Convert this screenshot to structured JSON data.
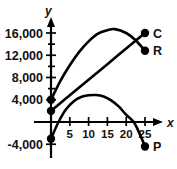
{
  "chart_data": {
    "type": "line",
    "title": "",
    "xlabel": "x",
    "ylabel": "y",
    "xlim": [
      -1.5,
      28
    ],
    "ylim": [
      -6000,
      18500
    ],
    "grid": false,
    "legend_position": "right-of-curve-endpoints",
    "x_ticks": [
      5,
      10,
      15,
      20,
      25
    ],
    "x_tick_labels": [
      "5",
      "10",
      "15",
      "20",
      "25"
    ],
    "y_ticks": [
      4000,
      8000,
      12000,
      16000
    ],
    "y_tick_labels": [
      "4,000",
      "8,000",
      "12,000",
      "16,000"
    ],
    "y_extra_tick_labels": [
      "-4,000"
    ],
    "y_extra_ticks": [
      -4000
    ],
    "series": [
      {
        "name": "C",
        "label": "C",
        "kind": "line",
        "description": "cost, straight increasing line",
        "y_intercept": 2000,
        "endpoint": {
          "x": 25,
          "y": 16000
        },
        "points": [
          {
            "x": 0,
            "y": 2000
          },
          {
            "x": 5,
            "y": 4800
          },
          {
            "x": 10,
            "y": 7600
          },
          {
            "x": 15,
            "y": 10400
          },
          {
            "x": 20,
            "y": 13200
          },
          {
            "x": 25,
            "y": 16000
          }
        ]
      },
      {
        "name": "R",
        "label": "R",
        "kind": "parabola",
        "description": "revenue, concave-down curve peaking near x=17",
        "y_intercept": 4000,
        "vertex": {
          "x": 17,
          "y": 16700
        },
        "endpoint": {
          "x": 25,
          "y": 12800
        },
        "points": [
          {
            "x": 0,
            "y": 4000
          },
          {
            "x": 2.5,
            "y": 7400
          },
          {
            "x": 5,
            "y": 10200
          },
          {
            "x": 7.5,
            "y": 12600
          },
          {
            "x": 10,
            "y": 14500
          },
          {
            "x": 12.5,
            "y": 15900
          },
          {
            "x": 15,
            "y": 16500
          },
          {
            "x": 17,
            "y": 16700
          },
          {
            "x": 20,
            "y": 16000
          },
          {
            "x": 22.5,
            "y": 14700
          },
          {
            "x": 25,
            "y": 12800
          }
        ]
      },
      {
        "name": "P",
        "label": "P",
        "kind": "parabola",
        "description": "profit = R - C, concave-down curve peaking near x=12",
        "y_intercept": -3000,
        "vertex": {
          "x": 12,
          "y": 4800
        },
        "endpoint": {
          "x": 25,
          "y": -4400
        },
        "x_intercepts": [
          2,
          22
        ],
        "points": [
          {
            "x": 0,
            "y": -3000
          },
          {
            "x": 2,
            "y": 0
          },
          {
            "x": 4,
            "y": 2300
          },
          {
            "x": 6,
            "y": 3700
          },
          {
            "x": 8,
            "y": 4500
          },
          {
            "x": 10,
            "y": 4800
          },
          {
            "x": 12,
            "y": 4850
          },
          {
            "x": 14,
            "y": 4600
          },
          {
            "x": 16,
            "y": 3900
          },
          {
            "x": 18,
            "y": 2800
          },
          {
            "x": 20,
            "y": 1300
          },
          {
            "x": 22,
            "y": 0
          },
          {
            "x": 23.5,
            "y": -2000
          },
          {
            "x": 25,
            "y": -4400
          }
        ]
      }
    ],
    "marked_points": [
      {
        "label": "",
        "x": 0,
        "y": 4000,
        "series": "R"
      },
      {
        "label": "",
        "x": 0,
        "y": 2000,
        "series": "C"
      },
      {
        "label": "",
        "x": 0,
        "y": -3000,
        "series": "P"
      },
      {
        "label": "C",
        "x": 25,
        "y": 16000,
        "series": "C"
      },
      {
        "label": "R",
        "x": 25,
        "y": 12800,
        "series": "R"
      },
      {
        "label": "P",
        "x": 25,
        "y": -4400,
        "series": "P"
      }
    ],
    "colors": {
      "curve": "#000000",
      "axis": "#000000",
      "background": "#ffffff"
    }
  }
}
